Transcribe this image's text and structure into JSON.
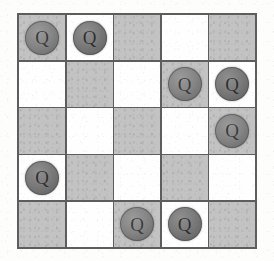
{
  "figure": {
    "kind": "chessboard-diagram",
    "title": "",
    "caption": ""
  },
  "board": {
    "rows": 5,
    "columns": 5,
    "piece_label": "Q",
    "piece_name": "queen",
    "colors": {
      "light_square": "#fefefe",
      "dark_square": "#c3c3c3",
      "grid_line": "#5d5d5d",
      "piece_fill": "#7a7a7a",
      "piece_letter": "#2e2e2e",
      "page_background": "#fdfdfc"
    },
    "square_pattern_first_cell": "dark",
    "queen_count": 8,
    "queen_positions": [
      {
        "row": 1,
        "col": 1
      },
      {
        "row": 1,
        "col": 2
      },
      {
        "row": 2,
        "col": 4
      },
      {
        "row": 2,
        "col": 5
      },
      {
        "row": 3,
        "col": 5
      },
      {
        "row": 4,
        "col": 1
      },
      {
        "row": 5,
        "col": 3
      },
      {
        "row": 5,
        "col": 4
      }
    ],
    "cells": [
      [
        {
          "shade": "dark",
          "piece": "Q"
        },
        {
          "shade": "light",
          "piece": "Q"
        },
        {
          "shade": "dark",
          "piece": ""
        },
        {
          "shade": "light",
          "piece": ""
        },
        {
          "shade": "dark",
          "piece": ""
        }
      ],
      [
        {
          "shade": "light",
          "piece": ""
        },
        {
          "shade": "dark",
          "piece": ""
        },
        {
          "shade": "light",
          "piece": ""
        },
        {
          "shade": "dark",
          "piece": "Q"
        },
        {
          "shade": "light",
          "piece": "Q"
        }
      ],
      [
        {
          "shade": "dark",
          "piece": ""
        },
        {
          "shade": "light",
          "piece": ""
        },
        {
          "shade": "dark",
          "piece": ""
        },
        {
          "shade": "light",
          "piece": ""
        },
        {
          "shade": "dark",
          "piece": "Q"
        }
      ],
      [
        {
          "shade": "light",
          "piece": "Q"
        },
        {
          "shade": "dark",
          "piece": ""
        },
        {
          "shade": "light",
          "piece": ""
        },
        {
          "shade": "dark",
          "piece": ""
        },
        {
          "shade": "light",
          "piece": ""
        }
      ],
      [
        {
          "shade": "dark",
          "piece": ""
        },
        {
          "shade": "light",
          "piece": ""
        },
        {
          "shade": "dark",
          "piece": "Q"
        },
        {
          "shade": "light",
          "piece": "Q"
        },
        {
          "shade": "dark",
          "piece": ""
        }
      ]
    ]
  }
}
